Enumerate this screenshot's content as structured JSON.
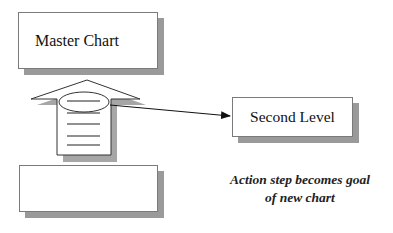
{
  "diagram": {
    "nodes": [
      {
        "id": "master",
        "label": "Master Chart"
      },
      {
        "id": "second",
        "label": "Second Level"
      },
      {
        "id": "bottom",
        "label": ""
      }
    ],
    "arrow_up": {
      "description": "Up-arrow with document lines linking bottom box to Master Chart",
      "line_count": 5
    },
    "connector": {
      "from": "action-step-ellipse",
      "to": "second"
    },
    "caption": {
      "line1": "Action step becomes goal",
      "line2": "of new chart"
    },
    "colors": {
      "stroke": "#333333",
      "shadow": "#9a9a9a",
      "fill": "#ffffff"
    }
  }
}
